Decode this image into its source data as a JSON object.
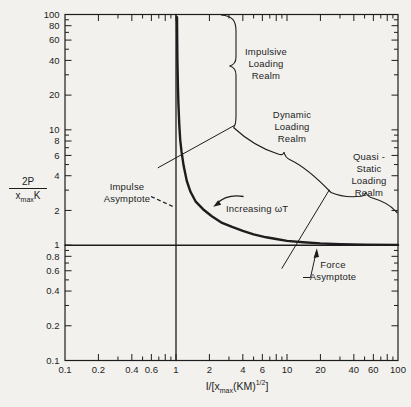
{
  "figure": {
    "background": "#f2f1ee",
    "ink": "#1d1d1d"
  },
  "chart_data": {
    "type": "line",
    "scale": "log-log",
    "grid": false,
    "legend": "none",
    "xlim": [
      0.1,
      100
    ],
    "ylim": [
      0.1,
      100
    ],
    "xlabel": "I/[x_max(KM)^1/2]",
    "ylabel": "2P/(x_max K)",
    "xlabel_parts": {
      "p1": "I/[x",
      "sub1": "max",
      "p2": "(KM)",
      "sup1": "1/2",
      "p3": "]"
    },
    "ylabel_parts": {
      "numerator": "2P",
      "denom_base": "x",
      "denom_sub": "max",
      "denom_unit": "K"
    },
    "x_tick_labels": [
      "0.1",
      "0.2",
      "0.4",
      "0.6",
      "1",
      "2",
      "4",
      "6",
      "10",
      "20",
      "40",
      "60",
      "100"
    ],
    "y_tick_labels": [
      "100",
      "80",
      "60",
      "40",
      "20",
      "10",
      "8",
      "6",
      "4",
      "2",
      "1",
      "0.8",
      "0.6",
      "0.4",
      "0.2",
      "0.1"
    ],
    "labels": {
      "impulsive_realm": "Impulsive\nLoading\nRealm",
      "dynamic_realm": "Dynamic\nLoading\nRealm",
      "quasi_static_realm": "Quasi - Static\nLoading\nRealm",
      "impulse_asymptote": "Impulse\nAsymptote",
      "force_asymptote": "Force\nAsymptote",
      "increasing_omega": "Increasing ωT"
    },
    "series": [
      {
        "id": "response_curve",
        "name": "Shock response curve",
        "points": [
          [
            1.02,
            95
          ],
          [
            1.025,
            60
          ],
          [
            1.03,
            40
          ],
          [
            1.04,
            24
          ],
          [
            1.05,
            17
          ],
          [
            1.07,
            11
          ],
          [
            1.09,
            8.2
          ],
          [
            1.12,
            6.5
          ],
          [
            1.17,
            4.9
          ],
          [
            1.25,
            3.6
          ],
          [
            1.35,
            2.9
          ],
          [
            1.5,
            2.4
          ],
          [
            1.75,
            2.05
          ],
          [
            2.1,
            1.78
          ],
          [
            2.6,
            1.56
          ],
          [
            3.2,
            1.44
          ],
          [
            4,
            1.33
          ],
          [
            5,
            1.24
          ],
          [
            6.5,
            1.17
          ],
          [
            8,
            1.13
          ],
          [
            10,
            1.09
          ],
          [
            14,
            1.06
          ],
          [
            20,
            1.035
          ],
          [
            30,
            1.02
          ],
          [
            50,
            1.01
          ],
          [
            100,
            1.005
          ]
        ]
      },
      {
        "id": "impulse_asymptote",
        "name": "Impulse asymptote (x = 1)",
        "points": [
          [
            1,
            0.1
          ],
          [
            1,
            100
          ]
        ]
      },
      {
        "id": "force_asymptote",
        "name": "Force asymptote (y = 1)",
        "points": [
          [
            0.1,
            1
          ],
          [
            100,
            1
          ]
        ]
      },
      {
        "id": "impulsive_dynamic_boundary",
        "name": "Impulsive realm boundary line",
        "points": [
          [
            0.69,
            4.7
          ],
          [
            3.35,
            10.9
          ]
        ]
      },
      {
        "id": "dynamic_quasistatic_boundary",
        "name": "Dynamic / quasi-static boundary line",
        "points": [
          [
            9.0,
            0.63
          ],
          [
            24,
            3.0
          ]
        ]
      }
    ]
  }
}
